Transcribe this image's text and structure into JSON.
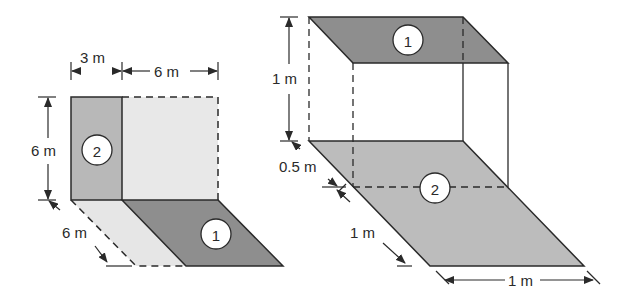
{
  "left_figure": {
    "surface_2_label": "2",
    "surface_1_label": "1",
    "dim_width_small": "3 m",
    "dim_width_large": "6 m",
    "dim_height": "6 m",
    "dim_depth": "6 m"
  },
  "right_figure": {
    "surface_1_label": "1",
    "surface_2_label": "2",
    "dim_height": "1 m",
    "dim_offset": "0.5 m",
    "dim_depth": "1 m",
    "dim_width": "1 m"
  },
  "colors": {
    "dark_fill": "#8c8c8c",
    "medium_fill": "#b9b9b9",
    "light_fill": "#e4e4e4",
    "line": "#2a2a2a"
  }
}
